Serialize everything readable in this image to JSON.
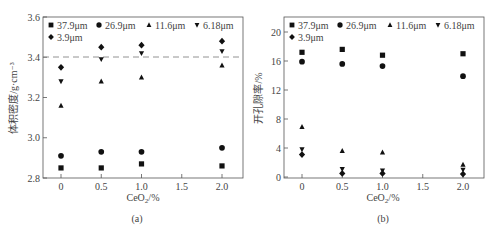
{
  "legend": {
    "items": [
      {
        "label": "37.9μm",
        "marker": "square"
      },
      {
        "label": "26.9μm",
        "marker": "circle"
      },
      {
        "label": "11.6μm",
        "marker": "triangle-up"
      },
      {
        "label": "6.18μm",
        "marker": "triangle-down"
      },
      {
        "label": "3.9μm",
        "marker": "diamond"
      }
    ]
  },
  "panels": {
    "a": {
      "caption": "(a)",
      "xlabel": "CeO",
      "xlabel_sub": "2",
      "xlabel_suffix": "/%",
      "ylabel": "体积密度/g·cm⁻³"
    },
    "b": {
      "caption": "(b)",
      "xlabel": "CeO",
      "xlabel_sub": "2",
      "xlabel_suffix": "/%",
      "ylabel": "开孔隙率/%"
    }
  },
  "chart_data": [
    {
      "type": "scatter",
      "title": "(a)",
      "xlabel": "CeO2/%",
      "ylabel": "体积密度/g·cm-3",
      "xlim": [
        -0.2,
        2.2
      ],
      "ylim": [
        2.8,
        3.6
      ],
      "xticks": [
        "0",
        "0.5",
        "1.0",
        "1.5",
        "2.0"
      ],
      "yticks": [
        "2.8",
        "3.0",
        "3.2",
        "3.4",
        "3.6"
      ],
      "reference_line": {
        "y": 3.4,
        "style": "dashed"
      },
      "legend_position": "top inside",
      "grid": false,
      "x": [
        0,
        0.5,
        1.0,
        2.0
      ],
      "series": [
        {
          "name": "37.9μm",
          "marker": "square",
          "values": [
            2.85,
            2.85,
            2.87,
            2.86
          ]
        },
        {
          "name": "26.9μm",
          "marker": "circle",
          "values": [
            2.91,
            2.93,
            2.93,
            2.95
          ]
        },
        {
          "name": "11.6μm",
          "marker": "triangle-up",
          "values": [
            3.16,
            3.28,
            3.3,
            3.36
          ]
        },
        {
          "name": "6.18μm",
          "marker": "triangle-down",
          "values": [
            3.28,
            3.39,
            3.42,
            3.43
          ]
        },
        {
          "name": "3.9μm",
          "marker": "diamond",
          "values": [
            3.35,
            3.45,
            3.46,
            3.48
          ]
        }
      ]
    },
    {
      "type": "scatter",
      "title": "(b)",
      "xlabel": "CeO2/%",
      "ylabel": "开孔隙率/%",
      "xlim": [
        -0.2,
        2.2
      ],
      "ylim": [
        0,
        21
      ],
      "xticks": [
        "0",
        "0.5",
        "1.0",
        "1.5",
        "2.0"
      ],
      "yticks": [
        "0",
        "4",
        "8",
        "12",
        "16",
        "20"
      ],
      "legend_position": "top inside",
      "grid": false,
      "x": [
        0,
        0.5,
        1.0,
        2.0
      ],
      "series": [
        {
          "name": "37.9μm",
          "marker": "square",
          "values": [
            17.2,
            17.6,
            16.8,
            17.0
          ]
        },
        {
          "name": "26.9μm",
          "marker": "circle",
          "values": [
            15.9,
            15.6,
            15.3,
            13.9
          ]
        },
        {
          "name": "11.6μm",
          "marker": "triangle-up",
          "values": [
            6.9,
            3.6,
            3.4,
            1.7
          ]
        },
        {
          "name": "6.18μm",
          "marker": "triangle-down",
          "values": [
            3.8,
            1.1,
            0.9,
            1.0
          ]
        },
        {
          "name": "3.9μm",
          "marker": "diamond",
          "values": [
            3.1,
            0.5,
            0.5,
            0.4
          ]
        }
      ]
    }
  ]
}
